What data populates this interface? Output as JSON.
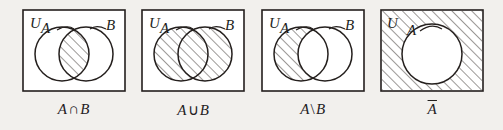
{
  "figure": {
    "background_color": "#f2f0ed",
    "ink_color": "#241f1d",
    "hatch_color": "#3a3330",
    "panel_count": 4
  },
  "panels": [
    {
      "id": "intersection",
      "caption_left": "A",
      "caption_op": "∩",
      "caption_right": "B",
      "caption_full": "A∩B",
      "universe_label": "U",
      "set_a_label": "A",
      "set_b_label": "B",
      "shaded_region": "intersection",
      "shading": "diagonal-hatch",
      "circle_count": 2
    },
    {
      "id": "union",
      "caption_left": "A",
      "caption_op": "∪",
      "caption_right": "B",
      "caption_full": "A∪B",
      "universe_label": "U",
      "set_a_label": "A",
      "set_b_label": "B",
      "shaded_region": "union",
      "shading": "diagonal-hatch",
      "circle_count": 2
    },
    {
      "id": "difference",
      "caption_left": "A",
      "caption_op": "\\",
      "caption_right": "B",
      "caption_full": "A\\B",
      "universe_label": "U",
      "set_a_label": "A",
      "set_b_label": "B",
      "shaded_region": "a-minus-b",
      "shading": "diagonal-hatch",
      "circle_count": 2
    },
    {
      "id": "complement",
      "caption_left": "A",
      "caption_op": "",
      "caption_right": "",
      "caption_full": "A̅",
      "universe_label": "U",
      "set_a_label": "A",
      "set_b_label": "",
      "shaded_region": "complement-of-a",
      "shading": "diagonal-hatch",
      "circle_count": 1
    }
  ]
}
